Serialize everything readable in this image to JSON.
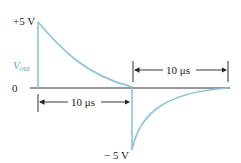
{
  "diagram": {
    "labels": {
      "pos_peak": "+5 V",
      "neg_peak": "− 5 V",
      "zero": "0",
      "vout_main": "V",
      "vout_sub": "out",
      "dim_top": "10 μs",
      "dim_bottom": "10 μs"
    },
    "colors": {
      "waveform": "#8cc4dc",
      "axis": "#333333",
      "text": "#222222",
      "vout_label": "#5aa9cf"
    },
    "geometry": {
      "baseline_y": 88,
      "pos_edge_x": 38,
      "pos_top_y": 22,
      "neg_edge_x": 132,
      "neg_bottom_y": 150,
      "end_x": 230
    }
  }
}
